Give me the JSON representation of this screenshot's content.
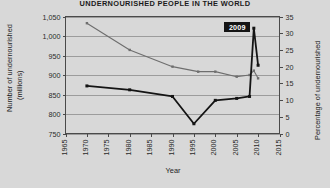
{
  "chart_data": {
    "type": "line",
    "title": "UNDERNOURISHED PEOPLE IN THE WORLD",
    "xlabel": "Year",
    "ylabel": "Number of undernourished (millions)",
    "ylabel_line1": "Number of undernourished",
    "ylabel_line2": "(millions)",
    "y2label": "Percentage of undernourished",
    "grid": true,
    "legend": "none",
    "xlim": [
      1965,
      2015
    ],
    "ylim": [
      750,
      1050
    ],
    "y2lim": [
      0,
      35
    ],
    "xticks": [
      1965,
      1970,
      1975,
      1980,
      1985,
      1990,
      1995,
      2000,
      2005,
      2010,
      2015
    ],
    "yticks": [
      750,
      800,
      850,
      900,
      950,
      1000,
      1050
    ],
    "ytick_labels": [
      "750",
      "800",
      "850",
      "900",
      "950",
      "1,000",
      "1,050"
    ],
    "y2ticks": [
      0,
      5,
      10,
      15,
      20,
      25,
      30,
      35
    ],
    "y2tick_labels": [
      "0",
      "5",
      "10",
      "15",
      "20",
      "25",
      "30",
      "35"
    ],
    "annotations": [
      {
        "label": "2009",
        "x": 2009,
        "axis": "left",
        "value": 1020
      }
    ],
    "series": [
      {
        "name": "Percentage of undernourished",
        "axis": "right",
        "color": "#6e6e6e",
        "x": [
          1970,
          1980,
          1990,
          1996,
          2000,
          2005,
          2008,
          2009,
          2010
        ],
        "values": [
          33.0,
          25.0,
          20.0,
          18.5,
          18.5,
          17.0,
          17.5,
          18.8,
          16.5
        ]
      },
      {
        "name": "Number of undernourished (millions)",
        "axis": "left",
        "color": "#141414",
        "x": [
          1970,
          1980,
          1990,
          1995,
          2000,
          2005,
          2008,
          2009,
          2010
        ],
        "values": [
          872,
          862,
          845,
          775,
          835,
          840,
          845,
          1020,
          925
        ]
      }
    ]
  }
}
